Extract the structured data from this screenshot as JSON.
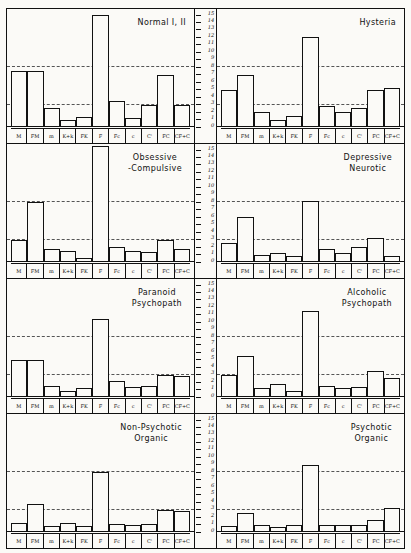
{
  "figure": {
    "name": "rorschach-determinant-profiles",
    "categories": [
      "M",
      "FM",
      "m",
      "K+k",
      "FK",
      "F",
      "Fc",
      "c",
      "C'",
      "FC",
      "CF+C"
    ],
    "axis": {
      "min": 0,
      "max": 15,
      "ticks": [
        0,
        1,
        2,
        3,
        4,
        5,
        6,
        7,
        8,
        9,
        10,
        11,
        12,
        13,
        14,
        15
      ],
      "reference_lines": [
        3,
        8
      ]
    }
  },
  "chart_data": {
    "type": "bar",
    "xlabel": "",
    "ylabel": "",
    "ylim": [
      0,
      15
    ],
    "grid": false,
    "legend": "none",
    "categories": [
      "M",
      "FM",
      "m",
      "K+k",
      "FK",
      "F",
      "Fc",
      "c",
      "C'",
      "FC",
      "CF+C"
    ],
    "reference_lines": [
      3,
      8
    ],
    "panels": [
      {
        "title": "Normal I, II",
        "title_lines": "Normal I, II",
        "values": [
          7.5,
          7.5,
          2.5,
          1.0,
          1.3,
          15.0,
          3.5,
          1.2,
          3.0,
          7.0,
          3.0
        ]
      },
      {
        "title": "Hysteria",
        "title_lines": "Hysteria",
        "values": [
          5.0,
          7.0,
          2.0,
          1.0,
          1.5,
          12.0,
          2.8,
          2.0,
          2.5,
          5.0,
          5.2
        ]
      },
      {
        "title": "Obsessive -Compulsive",
        "title_lines": "Obsessive\n-Compulsive",
        "values": [
          3.0,
          8.0,
          1.8,
          1.5,
          0.5,
          15.5,
          2.0,
          1.5,
          1.3,
          3.0,
          1.8
        ]
      },
      {
        "title": "Depressive Neurotic",
        "title_lines": "Depressive\nNeurotic",
        "values": [
          2.5,
          6.0,
          1.0,
          1.2,
          0.8,
          8.2,
          1.8,
          1.2,
          2.0,
          3.2,
          0.8
        ]
      },
      {
        "title": "Paranoid Psychopath",
        "title_lines": "Paranoid\nPsychopath",
        "values": [
          5.0,
          5.0,
          1.5,
          0.8,
          1.2,
          10.5,
          2.2,
          1.3,
          1.5,
          3.0,
          2.8
        ]
      },
      {
        "title": "Alcoholic Psychopath",
        "title_lines": "Alcoholic\nPsychopath",
        "values": [
          3.0,
          5.5,
          1.2,
          1.8,
          0.8,
          11.5,
          1.5,
          1.2,
          1.3,
          3.5,
          2.5
        ]
      },
      {
        "title": "Non-Psychotic Organic",
        "title_lines": "Non-Psychotic\nOrganic",
        "values": [
          1.2,
          3.8,
          0.8,
          1.2,
          0.8,
          8.0,
          1.1,
          0.9,
          1.1,
          3.0,
          2.8
        ]
      },
      {
        "title": "Psychotic Organic",
        "title_lines": "Psychotic\nOrganic",
        "values": [
          0.8,
          2.6,
          0.9,
          0.7,
          1.0,
          9.0,
          0.9,
          1.0,
          0.9,
          1.6,
          3.2
        ]
      }
    ]
  }
}
